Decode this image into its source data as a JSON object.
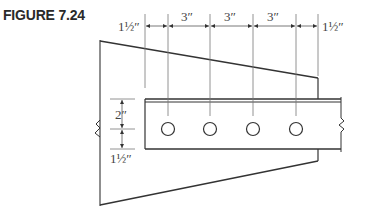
{
  "figure": {
    "label": "FIGURE 7.24"
  },
  "dimensions": {
    "horizontal": [
      {
        "id": "edge-left",
        "text": "1½″"
      },
      {
        "id": "pitch-1",
        "text": "3″"
      },
      {
        "id": "pitch-2",
        "text": "3″"
      },
      {
        "id": "pitch-3",
        "text": "3″"
      },
      {
        "id": "edge-right",
        "text": "1½″"
      }
    ],
    "vertical": [
      {
        "id": "gage",
        "text": "2″"
      },
      {
        "id": "edge-bottom",
        "text": "1½″"
      }
    ]
  },
  "bolts": {
    "count": 4
  },
  "colors": {
    "line": "#333333",
    "thin_line": "#666666",
    "title": "#2a2a2a"
  }
}
